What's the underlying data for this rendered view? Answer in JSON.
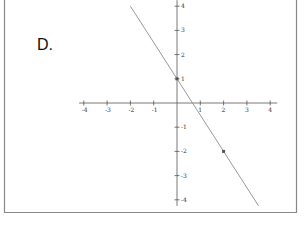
{
  "problem_label": "D.",
  "chart_data": {
    "type": "line",
    "title": "",
    "xlabel": "",
    "ylabel": "",
    "xlim": [
      -4,
      4
    ],
    "ylim": [
      -4,
      4
    ],
    "grid": false,
    "x_ticks": [
      -4,
      -3,
      -2,
      -1,
      1,
      2,
      3,
      4
    ],
    "y_ticks": [
      4,
      3,
      2,
      1,
      -1,
      -2,
      -3,
      -4
    ],
    "x_tick_labels": [
      "-4",
      "-3",
      "-2",
      "-1",
      "1",
      "2",
      "3",
      "4"
    ],
    "y_tick_labels": [
      "4",
      "3",
      "2",
      "1",
      "-1",
      "-2",
      "-3",
      "-4"
    ],
    "series": [
      {
        "name": "line",
        "equation": "y = -1.5x + 1",
        "slope": -1.5,
        "intercept": 1,
        "x": [
          -2.0,
          3.5
        ],
        "y": [
          4.0,
          -4.25
        ],
        "color": "#999999"
      }
    ],
    "points": [
      {
        "x": 0,
        "y": 1
      },
      {
        "x": 2,
        "y": -2
      }
    ],
    "colors": {
      "axis": "#555555",
      "line": "#999999",
      "border": "#888888",
      "point": "#555555"
    }
  }
}
